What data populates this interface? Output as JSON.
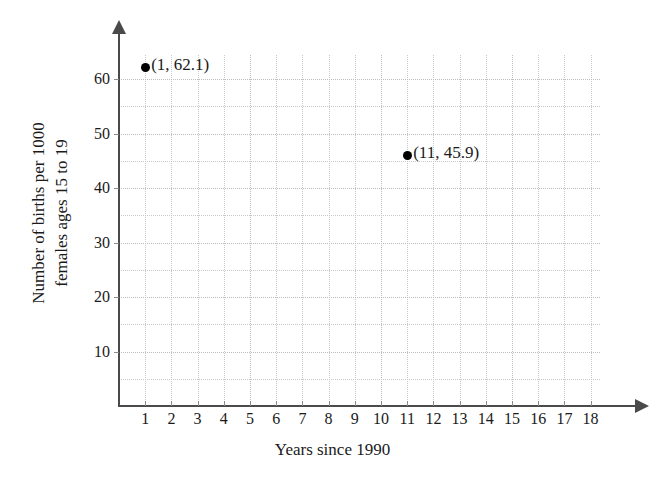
{
  "chart_data": {
    "type": "scatter",
    "title": "",
    "xlabel": "Years since 1990",
    "ylabel_lines": [
      "Number of births per 1000",
      "females ages 15 to 19"
    ],
    "ylabel": "Number of births per 1000 females ages 15 to 19",
    "xlim": [
      0,
      18.4
    ],
    "ylim": [
      0,
      67
    ],
    "xticks": [
      1,
      2,
      3,
      4,
      5,
      6,
      7,
      8,
      9,
      10,
      11,
      12,
      13,
      14,
      15,
      16,
      17,
      18
    ],
    "xtick_labels": [
      "1",
      "2",
      "3",
      "4",
      "5",
      "6",
      "7",
      "8",
      "9",
      "10",
      "11",
      "12",
      "13",
      "14",
      "15",
      "16",
      "17",
      "18"
    ],
    "yticks": [
      10,
      20,
      30,
      40,
      50,
      60
    ],
    "ytick_labels": [
      "10",
      "20",
      "30",
      "40",
      "50",
      "60"
    ],
    "grid": true,
    "grid_style": "dotted",
    "grid_color": "#c9c9c9",
    "grid_x_step": 1,
    "grid_y_step": 5,
    "legend": "none",
    "point_color": "#000000",
    "points": [
      {
        "x": 1,
        "y": 62.1,
        "label": "(1, 62.1)"
      },
      {
        "x": 11,
        "y": 45.9,
        "label": "(11, 45.9)"
      }
    ]
  },
  "axes": {
    "x_axis_name": "x-axis",
    "y_axis_name": "y-axis"
  }
}
